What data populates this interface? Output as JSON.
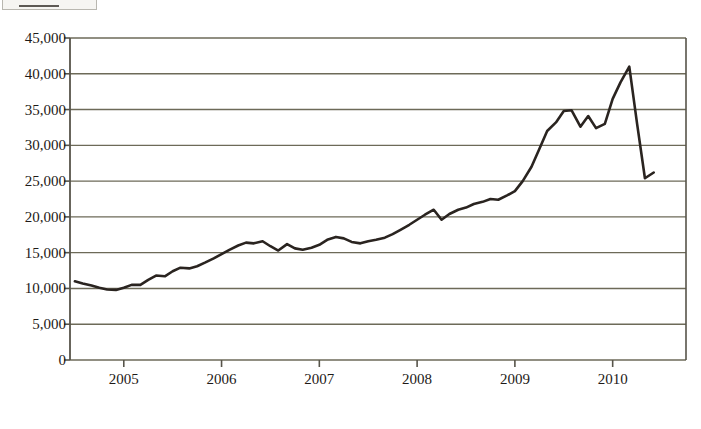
{
  "header": {
    "box_label": "",
    "clipped_title": ""
  },
  "chart_data": {
    "type": "line",
    "title": "",
    "subtitle": "",
    "xlabel": "",
    "ylabel": "",
    "grid": true,
    "legend": "none",
    "series_name": "value",
    "y_ticks": [
      "0",
      "5,000",
      "10,000",
      "15,000",
      "20,000",
      "25,000",
      "30,000",
      "35,000",
      "40,000",
      "45,000"
    ],
    "y_tick_values": [
      0,
      5000,
      10000,
      15000,
      20000,
      25000,
      30000,
      35000,
      40000,
      45000
    ],
    "ylim": [
      0,
      45000
    ],
    "x_ticks": [
      "2005",
      "2006",
      "2007",
      "2008",
      "2009",
      "2010"
    ],
    "x_tick_values": [
      2005,
      2006,
      2007,
      2008,
      2009,
      2010
    ],
    "xlim": [
      2004.45,
      2010.75
    ],
    "line_color": "#2a2420",
    "grid_color": "#6d6a58",
    "axis_color": "#57544a",
    "background_color": "#ffffff",
    "x": [
      2004.5,
      2004.58,
      2004.67,
      2004.75,
      2004.83,
      2004.92,
      2005.0,
      2005.08,
      2005.17,
      2005.25,
      2005.33,
      2005.42,
      2005.5,
      2005.58,
      2005.67,
      2005.75,
      2005.83,
      2005.92,
      2006.0,
      2006.08,
      2006.17,
      2006.25,
      2006.33,
      2006.42,
      2006.5,
      2006.58,
      2006.67,
      2006.75,
      2006.83,
      2006.92,
      2007.0,
      2007.08,
      2007.17,
      2007.25,
      2007.33,
      2007.42,
      2007.5,
      2007.58,
      2007.67,
      2007.75,
      2007.83,
      2007.92,
      2008.0,
      2008.08,
      2008.17,
      2008.25,
      2008.33,
      2008.42,
      2008.5,
      2008.58,
      2008.67,
      2008.75,
      2008.83,
      2008.92,
      2009.0,
      2009.08,
      2009.17,
      2009.25,
      2009.33,
      2009.42,
      2009.5,
      2009.58,
      2009.67,
      2009.75,
      2009.83,
      2009.92,
      2010.0,
      2010.08,
      2010.17,
      2010.25,
      2010.33,
      2010.42
    ],
    "values": [
      11000,
      10700,
      10400,
      10100,
      9850,
      9800,
      10100,
      10500,
      10500,
      11200,
      11800,
      11700,
      12400,
      12900,
      12800,
      13100,
      13600,
      14200,
      14800,
      15400,
      16000,
      16400,
      16300,
      16600,
      15900,
      15300,
      16200,
      15600,
      15400,
      15700,
      16100,
      16800,
      17200,
      17000,
      16500,
      16300,
      16600,
      16800,
      17100,
      17600,
      18200,
      18900,
      19600,
      20300,
      21000,
      19600,
      20400,
      21000,
      21300,
      21800,
      22100,
      22500,
      22400,
      23000,
      23600,
      25000,
      27000,
      29500,
      32000,
      33200,
      34800,
      34900,
      32600,
      34100,
      32400,
      33000,
      36500,
      38800,
      41000,
      33000,
      25400,
      26200
    ]
  }
}
